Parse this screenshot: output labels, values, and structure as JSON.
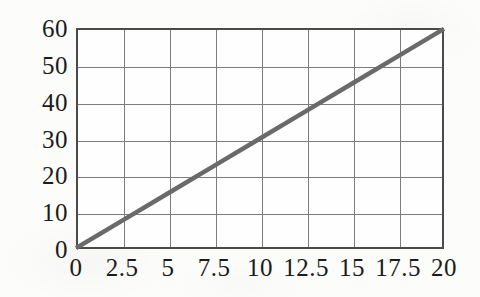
{
  "chart_data": {
    "type": "line",
    "title": "",
    "subtitle": "",
    "xlabel": "",
    "ylabel": "",
    "xlim": [
      0,
      20
    ],
    "ylim": [
      0,
      60
    ],
    "grid": true,
    "legend": false,
    "legend_position": "none",
    "line_color": "#6a6a6a",
    "grid_color": "#7c7c7c",
    "frame_color": "#4a4a4a",
    "background_color": "#fefefe",
    "label_color": "#1b1b1b",
    "xticks": [
      0,
      2.5,
      5,
      7.5,
      10,
      12.5,
      15,
      17.5,
      20
    ],
    "xtick_labels": [
      "0",
      "2.5",
      "5",
      "7.5",
      "10",
      "12.5",
      "15",
      "17.5",
      "20"
    ],
    "yticks": [
      0,
      10,
      20,
      30,
      40,
      50,
      60
    ],
    "ytick_labels": [
      "0",
      "10",
      "20",
      "30",
      "40",
      "50",
      "60"
    ],
    "series": [
      {
        "name": "",
        "x": [
          0,
          2.5,
          5,
          7.5,
          10,
          12.5,
          15,
          17.5,
          20
        ],
        "values": [
          0,
          7.5,
          15,
          22.5,
          30,
          37.5,
          45,
          52.5,
          60
        ]
      }
    ]
  }
}
